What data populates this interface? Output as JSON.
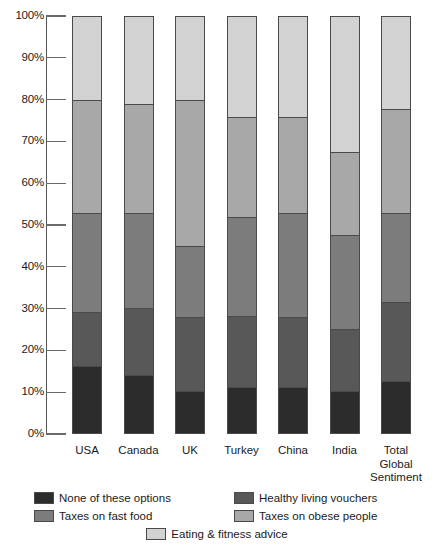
{
  "chart_data": {
    "type": "bar",
    "stacked": true,
    "stack_mode": "percent",
    "title": "",
    "subtitle": "",
    "xlabel": "",
    "ylabel": "",
    "ylim": [
      0,
      100
    ],
    "grid": false,
    "legend_position": "bottom",
    "ytick_labels": [
      "0%",
      "10%",
      "20%",
      "30%",
      "40%",
      "50%",
      "60%",
      "70%",
      "80%",
      "90%",
      "100%"
    ],
    "ytick_values": [
      0,
      10,
      20,
      30,
      40,
      50,
      60,
      70,
      80,
      90,
      100
    ],
    "categories": [
      "USA",
      "Canada",
      "UK",
      "Turkey",
      "China",
      "India",
      "Total Global Sentiment"
    ],
    "category_label_lines": [
      [
        "USA"
      ],
      [
        "Canada"
      ],
      [
        "UK"
      ],
      [
        "Turkey"
      ],
      [
        "China"
      ],
      [
        "India"
      ],
      [
        "Total",
        "Global",
        "Sentiment"
      ]
    ],
    "series": [
      {
        "name": "None of these options",
        "color": "#2c2c2c",
        "values": [
          16,
          14,
          10,
          11,
          11,
          10,
          12.5
        ]
      },
      {
        "name": "Healthy living vouchers",
        "color": "#585858",
        "values": [
          13,
          16,
          18,
          17,
          17,
          15,
          19
        ]
      },
      {
        "name": "Taxes on fast food",
        "color": "#7c7c7c",
        "values": [
          24,
          23,
          17,
          24,
          25,
          22.5,
          21.5
        ]
      },
      {
        "name": "Taxes on obese people",
        "color": "#a8a8a8",
        "values": [
          27,
          26,
          35,
          24,
          23,
          20,
          25
        ]
      },
      {
        "name": "Eating & fitness advice",
        "color": "#d2d2d2",
        "values": [
          20,
          21,
          20,
          24,
          24,
          32.5,
          22
        ]
      }
    ],
    "cumulative_tops": {
      "USA": [
        20,
        47,
        71,
        84,
        100
      ],
      "Canada": [
        21,
        47,
        70,
        86,
        100
      ],
      "UK": [
        20,
        55,
        72,
        90,
        100
      ],
      "Turkey": [
        24,
        48,
        72,
        89,
        100
      ],
      "China": [
        24,
        47,
        72,
        89,
        100
      ],
      "India": [
        32.5,
        52.5,
        75,
        90,
        100
      ],
      "Total Global Sentiment": [
        22,
        47,
        68.5,
        87.5,
        100
      ]
    }
  },
  "legend": {
    "entries": [
      {
        "label": "None of these options",
        "color": "#2c2c2c"
      },
      {
        "label": "Healthy living vouchers",
        "color": "#585858"
      },
      {
        "label": "Taxes on fast food",
        "color": "#7c7c7c"
      },
      {
        "label": "Taxes on obese people",
        "color": "#a8a8a8"
      },
      {
        "label": "Eating & fitness advice",
        "color": "#d2d2d2"
      }
    ]
  }
}
